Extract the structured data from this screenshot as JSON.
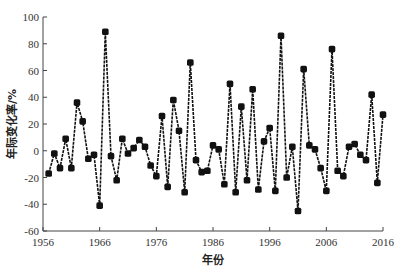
{
  "chart_data": {
    "type": "line",
    "title": "",
    "xlabel": "年份",
    "ylabel": "年际变化率/%",
    "xlim": [
      1956,
      2016
    ],
    "ylim": [
      -60,
      100
    ],
    "x_ticks": [
      1956,
      1966,
      1976,
      1986,
      1996,
      2006,
      2016
    ],
    "y_ticks": [
      -60,
      -40,
      -20,
      0,
      20,
      40,
      60,
      80,
      100
    ],
    "grid": false,
    "legend": null,
    "marker": "square-filled",
    "line_color": "#000000",
    "series": [
      {
        "name": "年际变化率",
        "x": [
          1957,
          1958,
          1959,
          1960,
          1961,
          1962,
          1963,
          1964,
          1965,
          1966,
          1967,
          1968,
          1969,
          1970,
          1971,
          1972,
          1973,
          1974,
          1975,
          1976,
          1977,
          1978,
          1979,
          1980,
          1981,
          1982,
          1983,
          1984,
          1985,
          1986,
          1987,
          1988,
          1989,
          1990,
          1991,
          1992,
          1993,
          1994,
          1995,
          1996,
          1997,
          1998,
          1999,
          2000,
          2001,
          2002,
          2003,
          2004,
          2005,
          2006,
          2007,
          2008,
          2009,
          2010,
          2011,
          2012,
          2013,
          2014,
          2015,
          2016
        ],
        "values": [
          -17,
          -2,
          -13,
          9,
          -13,
          36,
          22,
          -6,
          -3,
          -41,
          89,
          -4,
          -22,
          9,
          -2,
          2,
          8,
          3,
          -11,
          -19,
          26,
          -27,
          38,
          15,
          -31,
          66,
          -7,
          -16,
          -15,
          4,
          1,
          -25,
          50,
          -31,
          33,
          -22,
          46,
          -29,
          7,
          17,
          -30,
          86,
          -20,
          3,
          -45,
          61,
          4,
          1,
          -13,
          -30,
          76,
          -15,
          -19,
          3,
          5,
          -3,
          -7,
          42,
          -24,
          27
        ]
      }
    ]
  }
}
